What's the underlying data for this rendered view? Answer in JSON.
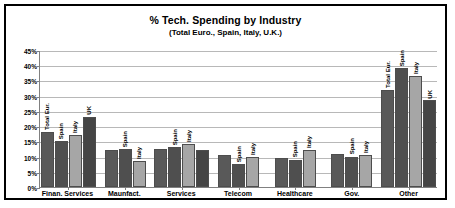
{
  "chart_data": {
    "type": "bar",
    "title": "% Tech. Spending by Industry",
    "subtitle": "(Total Euro., Spain, Italy, U.K.)",
    "xlabel": "",
    "ylabel": "",
    "ylim": [
      0,
      45
    ],
    "ytick_labels": [
      "45%",
      "40%",
      "35%",
      "30%",
      "25%",
      "20%",
      "15%",
      "10%",
      "5%",
      "0%"
    ],
    "ytick_values": [
      45,
      40,
      35,
      30,
      25,
      20,
      15,
      10,
      5,
      0
    ],
    "grid": true,
    "legend_position": "none",
    "series_names": [
      "Total Eur.",
      "Spain",
      "Italy",
      "UK"
    ],
    "categories": [
      "Finan. Services",
      "Maunfact.",
      "Services",
      "Telecom",
      "Healthcare",
      "Gov.",
      "Other"
    ],
    "series": [
      {
        "name": "Total Eur.",
        "values": [
          18,
          12,
          12.5,
          10.5,
          9.5,
          11,
          32
        ]
      },
      {
        "name": "Spain",
        "values": [
          15,
          12.5,
          13,
          7.5,
          9,
          10,
          39
        ]
      },
      {
        "name": "Italy",
        "values": [
          17,
          8.5,
          14,
          10,
          12,
          10.5,
          36.5
        ]
      },
      {
        "name": "UK",
        "values": [
          23,
          null,
          12,
          null,
          null,
          null,
          28.5
        ]
      }
    ],
    "bar_annotations": {
      "Finan. Services": [
        "Total Eur.",
        "Spain",
        "Italy",
        "UK"
      ],
      "Maunfact.": [
        "",
        "Spain",
        "Italy",
        ""
      ],
      "Services": [
        "",
        "Spain",
        "Italy",
        ""
      ],
      "Telecom": [
        "",
        "Spain",
        "Italy",
        ""
      ],
      "Healthcare": [
        "",
        "Spain",
        "Italy",
        ""
      ],
      "Gov.": [
        "",
        "Spain",
        "Italy",
        ""
      ],
      "Other": [
        "Total Eur.",
        "Spain",
        "Italy",
        "UK"
      ]
    },
    "colors": {
      "series_0": "#595959",
      "series_1": "#4f4f4f",
      "series_2": "#a6a6a6",
      "series_3": "#454545",
      "gridline": "#b8b8b8",
      "axis": "#808080",
      "frame": "#000000",
      "background": "#ffffff"
    }
  }
}
